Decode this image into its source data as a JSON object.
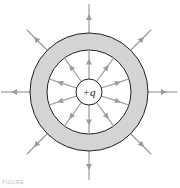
{
  "diagram": {
    "type": "conducting spherical shell around point charge",
    "charge_label": "+q",
    "caption": "FIGURE",
    "center": [
      89,
      92
    ],
    "shell": {
      "outer_radius": 59,
      "inner_radius": 42,
      "fill": "#d4d4d4",
      "stroke": "#222222"
    },
    "charge_circle": {
      "radius": 13,
      "fill": "#ffffff",
      "stroke": "#222222"
    },
    "field_line_color": "#9b9b9b",
    "inner_field_lines": {
      "count": 10,
      "from_radius": 13,
      "to_radius": 42,
      "direction": "outward"
    },
    "outer_field_lines": {
      "count": 8,
      "from_radius": 59,
      "to_radius": 88,
      "direction": "outward"
    }
  }
}
